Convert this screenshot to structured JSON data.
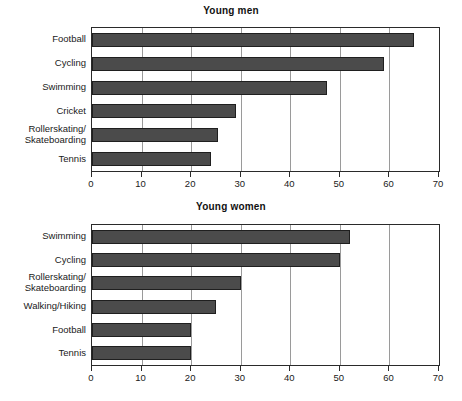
{
  "chart_data": [
    {
      "type": "bar",
      "orientation": "horizontal",
      "title": "Young men",
      "xlabel": "",
      "ylabel": "",
      "xlim": [
        0,
        70
      ],
      "xticks": [
        0,
        10,
        20,
        30,
        40,
        50,
        60,
        70
      ],
      "grid": true,
      "legend": "none",
      "categories": [
        "Football",
        "Cycling",
        "Swimming",
        "Cricket",
        "Rollerskating/\nSkateboarding",
        "Tennis"
      ],
      "values": [
        65,
        59,
        47.5,
        29,
        25.5,
        24
      ],
      "bar_color": "#4b4b4b",
      "bar_border_color": "#1f1f1f"
    },
    {
      "type": "bar",
      "orientation": "horizontal",
      "title": "Young women",
      "xlabel": "",
      "ylabel": "",
      "xlim": [
        0,
        70
      ],
      "xticks": [
        0,
        10,
        20,
        30,
        40,
        50,
        60,
        70
      ],
      "grid": true,
      "legend": "none",
      "categories": [
        "Swimming",
        "Cycling",
        "Rollerskating/\nSkateboarding",
        "Walking/Hiking",
        "Football",
        "Tennis"
      ],
      "values": [
        52,
        50,
        30,
        25,
        20,
        20
      ],
      "bar_color": "#4b4b4b",
      "bar_border_color": "#1f1f1f"
    }
  ]
}
